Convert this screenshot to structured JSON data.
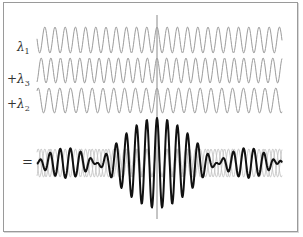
{
  "figure": {
    "title": "",
    "canvas": {
      "width": 303,
      "height": 237
    },
    "x_range": [
      37,
      282
    ],
    "center_x": 157,
    "center_line": {
      "y_top": 15,
      "y_bottom": 219,
      "color": "#8a8a8a"
    },
    "colors": {
      "component_wave": "#9c9c9c",
      "component_overlay": "#c4c4c4",
      "sum_wave": "#111111",
      "frame": "#9a9a9a"
    },
    "waves": [
      {
        "prefix": "",
        "symbol": "λ",
        "subscript": "1",
        "wavelength_px": 10.2,
        "center_y": 40,
        "amplitude_px": 13
      },
      {
        "prefix": "+",
        "symbol": "λ",
        "subscript": "3",
        "wavelength_px": 9.65,
        "center_y": 70.5,
        "amplitude_px": 12.5
      },
      {
        "prefix": "+",
        "symbol": "λ",
        "subscript": "2",
        "wavelength_px": 10.8,
        "center_y": 100.5,
        "amplitude_px": 12.5
      }
    ],
    "sum": {
      "label": "=",
      "center_y": 163,
      "overlay_amplitude_px": 14,
      "sum_unit_amplitude_px": 15
    }
  }
}
